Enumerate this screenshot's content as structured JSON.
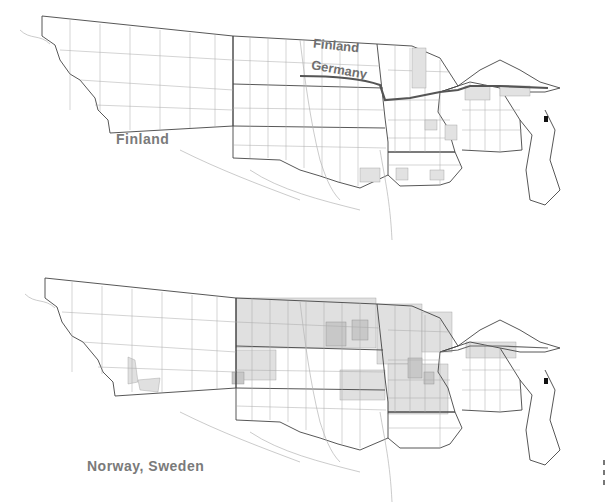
{
  "maps": [
    {
      "id": "top",
      "labels": {
        "west": "Finland",
        "boundary_upper": "Finland",
        "boundary_lower": "Germany"
      },
      "colors": {
        "outline": "#444444",
        "county": "#9a9a9a",
        "river": "#b0b0b0",
        "shade": "#e2e2e2",
        "shade_dark": "#cfcfcf",
        "boundary_line": "#555555",
        "label": "#7a7a7a"
      }
    },
    {
      "id": "bottom",
      "labels": {
        "southwest": "Norway, Sweden"
      },
      "colors": {
        "outline": "#444444",
        "county": "#9a9a9a",
        "river": "#b0b0b0",
        "shade": "#e2e2e2",
        "shade_dark": "#c4c4c4",
        "label": "#7a7a7a"
      }
    }
  ]
}
